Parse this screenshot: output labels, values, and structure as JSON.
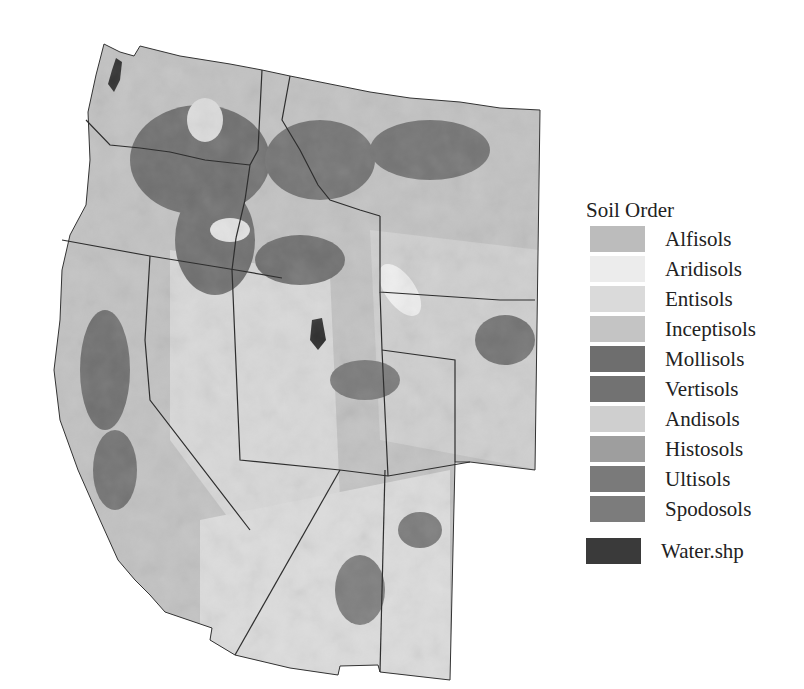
{
  "map": {
    "title": "Soil Orders of the Western United States",
    "region": "Western US states: WA, OR, CA, ID, NV, MT, WY, UT, CO, AZ, NM"
  },
  "legend": {
    "title": "Soil Order",
    "items": [
      {
        "label": "Alfisols",
        "color": "#bcbcbc"
      },
      {
        "label": "Aridisols",
        "color": "#ececec"
      },
      {
        "label": "Entisols",
        "color": "#dadada"
      },
      {
        "label": "Inceptisols",
        "color": "#c4c4c4"
      },
      {
        "label": "Mollisols",
        "color": "#6e6e6e"
      },
      {
        "label": "Vertisols",
        "color": "#727272"
      },
      {
        "label": "Andisols",
        "color": "#cfcfcf"
      },
      {
        "label": "Histosols",
        "color": "#9e9e9e"
      },
      {
        "label": "Ultisols",
        "color": "#7a7a7a"
      },
      {
        "label": "Spodosols",
        "color": "#7c7c7c"
      }
    ],
    "water": {
      "label": "Water.shp",
      "color": "#3a3a3a"
    }
  }
}
